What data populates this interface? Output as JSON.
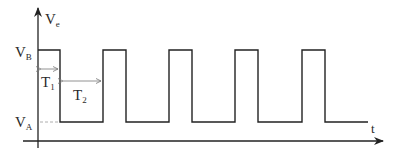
{
  "diagram": {
    "y_axis_label": "V",
    "y_axis_label_sub": "e",
    "x_axis_label": "t",
    "levels": [
      {
        "name": "high",
        "label": "V",
        "sub": "B"
      },
      {
        "name": "low",
        "label": "V",
        "sub": "A"
      }
    ],
    "intervals": [
      {
        "label": "T",
        "sub": "1",
        "meaning": "high duration"
      },
      {
        "label": "T",
        "sub": "2",
        "meaning": "low duration"
      }
    ],
    "waveform": {
      "type": "rectangular pulse train",
      "start_level": "high",
      "pulse_count": 5
    },
    "colors": {
      "line": "#222222",
      "dim_line": "#888888"
    }
  }
}
